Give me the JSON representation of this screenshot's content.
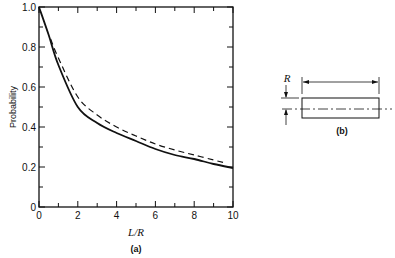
{
  "chart_data": [
    {
      "panel": "(a)",
      "type": "line",
      "title": "",
      "xlabel": "L/R",
      "ylabel": "Probability",
      "xlim": [
        0,
        10
      ],
      "ylim": [
        0,
        1.0
      ],
      "x_ticks": [
        "0",
        "2",
        "4",
        "6",
        "8",
        "10"
      ],
      "y_ticks": [
        "0",
        "0.2",
        "0.4",
        "0.6",
        "0.8",
        "1.0"
      ],
      "grid": false,
      "legend": "none",
      "series": [
        {
          "name": "solid",
          "style": "solid",
          "x": [
            0,
            0.5,
            1,
            2,
            3,
            4,
            5,
            6,
            7,
            8,
            9,
            10
          ],
          "values": [
            1.0,
            0.86,
            0.71,
            0.5,
            0.42,
            0.37,
            0.33,
            0.29,
            0.26,
            0.24,
            0.215,
            0.195
          ]
        },
        {
          "name": "dashed",
          "style": "dashed",
          "x": [
            0.6,
            1,
            2,
            3,
            4,
            5,
            6,
            7,
            8,
            9,
            9.6
          ],
          "values": [
            0.84,
            0.745,
            0.55,
            0.46,
            0.4,
            0.355,
            0.315,
            0.285,
            0.26,
            0.235,
            0.22
          ]
        }
      ],
      "caption": "(a)"
    }
  ],
  "diagram_b": {
    "label_R": "R",
    "caption": "(b)"
  }
}
